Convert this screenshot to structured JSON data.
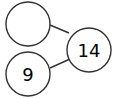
{
  "diagram": {
    "type": "number-bond",
    "nodes": [
      {
        "id": "part-top",
        "value": "",
        "cx": 28,
        "cy": 24,
        "r": 22
      },
      {
        "id": "part-bottom",
        "value": "9",
        "cx": 28,
        "cy": 74,
        "r": 22
      },
      {
        "id": "whole",
        "value": "14",
        "cx": 89,
        "cy": 50,
        "r": 22
      }
    ],
    "edges": [
      {
        "from": "part-top",
        "to": "whole"
      },
      {
        "from": "part-bottom",
        "to": "whole"
      }
    ],
    "colors": {
      "stroke": "#333333",
      "text": "#000000",
      "background": "#ffffff"
    }
  }
}
